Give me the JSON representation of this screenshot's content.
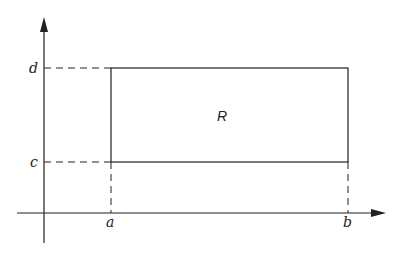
{
  "diagram": {
    "type": "rectangle-region-in-plane",
    "region_label": "R",
    "x_axis": {
      "labels": [
        "a",
        "b"
      ]
    },
    "y_axis": {
      "labels": [
        "c",
        "d"
      ]
    },
    "labels": {
      "a": "a",
      "b": "b",
      "c": "c",
      "d": "d",
      "R": "R"
    },
    "colors": {
      "ink": "#222222",
      "background": "#ffffff"
    }
  }
}
